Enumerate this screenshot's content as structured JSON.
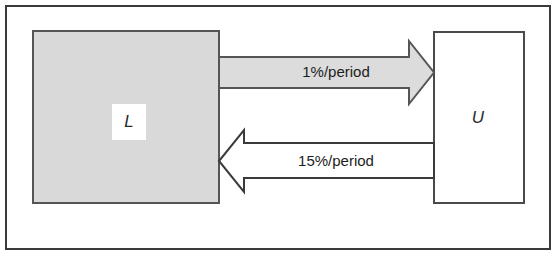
{
  "diagram": {
    "frame": {
      "border_color": "#3a3a3a",
      "background": "#ffffff"
    },
    "nodes": [
      {
        "id": "L",
        "label": "L",
        "name": "node-lower",
        "fill": "#d9d9d9",
        "stroke": "#555555"
      },
      {
        "id": "U",
        "label": "U",
        "name": "node-upper",
        "fill": "#ffffff",
        "stroke": "#4a4a4a"
      }
    ],
    "edges": [
      {
        "id": "L-to-U",
        "label": "1%/period",
        "direction": "right",
        "from": "L",
        "to": "U",
        "fill": "#dcdcdc",
        "stroke": "#555555"
      },
      {
        "id": "U-to-L",
        "label": "15%/period",
        "direction": "left",
        "from": "U",
        "to": "L",
        "fill": "#ffffff",
        "stroke": "#3a3a3a"
      }
    ]
  }
}
